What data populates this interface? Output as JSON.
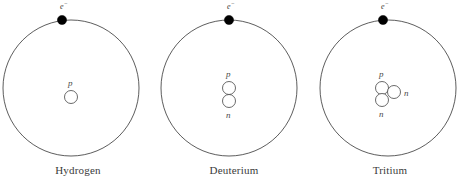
{
  "figure": {
    "title": "",
    "background_color": "#ffffff",
    "stroke_color": "#333333",
    "electron_fill": "#000000",
    "nucleon_fill": "#ffffff",
    "label_color": "#4a4a4a"
  },
  "atoms": [
    {
      "id": "hydrogen",
      "caption": "Hydrogen",
      "electron": {
        "label_symbol": "e",
        "label_charge": "−"
      },
      "nucleons": [
        {
          "type": "proton",
          "label": "p"
        }
      ]
    },
    {
      "id": "deuterium",
      "caption": "Deuterium",
      "electron": {
        "label_symbol": "e",
        "label_charge": "−"
      },
      "nucleons": [
        {
          "type": "proton",
          "label": "p"
        },
        {
          "type": "neutron",
          "label": "n"
        }
      ]
    },
    {
      "id": "tritium",
      "caption": "Tritium",
      "electron": {
        "label_symbol": "e",
        "label_charge": "−"
      },
      "nucleons": [
        {
          "type": "proton",
          "label": "p"
        },
        {
          "type": "neutron",
          "label": "n"
        },
        {
          "type": "neutron",
          "label": "n"
        }
      ]
    }
  ]
}
